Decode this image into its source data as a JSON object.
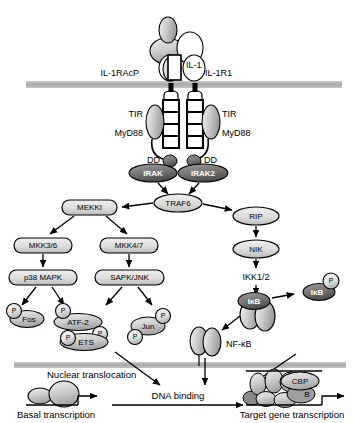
{
  "diagram": {
    "membrane_color": "#b0b0b0",
    "node_fill_light": "#d9d9d9",
    "node_fill_mid": "#bdbdbd",
    "node_fill_dark": "#6e6e6e",
    "stroke": "#000000"
  },
  "receptor": {
    "ligand_label": "IL-1",
    "left_chain_label": "IL-1RAcP",
    "right_chain_label": "IL-1R1",
    "tir_left_label": "TIR",
    "tir_right_label": "TIR",
    "mydd88_left_label": "MyD88",
    "mydd88_right_label": "MyD88",
    "dd_left_label": "DD",
    "dd_right_label": "DD",
    "irak_left_label": "IRAK",
    "irak_right_label": "IRAK2"
  },
  "cascade": {
    "traf6": "TRAF6",
    "mekki": "MEKKI",
    "rip": "RIP",
    "nik": "NIK",
    "ikk": "IKK1/2",
    "mkk36": "MKK3/6",
    "mkk47": "MKK4/7",
    "p38": "p38 MAPK",
    "sapk": "SAPK/JNK"
  },
  "nfkb_branch": {
    "ikb_bound": "IκB",
    "ikb_free": "IκB",
    "phospho_badge": "P",
    "nfkb": "NF-κB"
  },
  "transcription_factors": [
    {
      "name": "Fos",
      "phospho": [
        "P"
      ]
    },
    {
      "name": "ATF-2",
      "phospho": [
        "P",
        "P"
      ]
    },
    {
      "name": "ETS",
      "phospho": [
        "P"
      ]
    },
    {
      "name": "Jun",
      "phospho": [
        "P",
        "P"
      ]
    }
  ],
  "nucleus": {
    "nuclear_translocation": "Nuclear translocation",
    "dna_binding": "DNA binding",
    "basal_transcription": "Basal transcription",
    "target_gene_transcription": "Target gene transcription",
    "cbp_label": "CBP",
    "b_label": "B"
  }
}
